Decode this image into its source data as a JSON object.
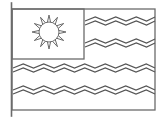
{
  "image": {
    "title": "Flag Coloring Page Outline",
    "subject": "national-flag-line-drawing",
    "width": 163,
    "height": 120,
    "background_color": "#ffffff",
    "line_color": "#6b6b6b",
    "line_color_dark": "#555555",
    "fill_color": "none"
  },
  "flagpole": {
    "name": "flagpole",
    "x": 11.5,
    "y_top": 3,
    "y_bottom": 116,
    "stroke_width": 1.6,
    "color": "#6b6b6b"
  },
  "flag": {
    "name": "flag-outline",
    "x_left": 12,
    "y_top": 9,
    "x_right": 155,
    "y_bottom": 110,
    "stroke_width": 1.3,
    "color": "#6b6b6b"
  },
  "canton": {
    "name": "canton-rectangle",
    "x_left": 12,
    "y_top": 9,
    "x_right": 84,
    "y_bottom": 59,
    "stroke_width": 1.3,
    "color": "#6b6b6b"
  },
  "sun": {
    "name": "sun-emblem",
    "center_x": 49,
    "center_y": 32,
    "circle_radius": 10,
    "ray_count": 12,
    "ray_inner_radius": 10,
    "ray_outer_radius": 17,
    "ray_half_angle_deg": 9,
    "stroke_width": 1,
    "color": "#6b6b6b"
  },
  "stripes": {
    "name": "zigzag-stripes",
    "count": 4,
    "period": 20.5,
    "amplitude": 4.2,
    "pair_offset": 4.0,
    "stroke_width": 1.1,
    "color": "#555555",
    "items": [
      {
        "id": 1,
        "center_y": 21,
        "x_start": 85,
        "x_end": 155,
        "span": "right-of-canton"
      },
      {
        "id": 2,
        "center_y": 43,
        "x_start": 85,
        "x_end": 155,
        "span": "right-of-canton"
      },
      {
        "id": 3,
        "center_y": 68,
        "x_start": 13,
        "x_end": 155,
        "span": "full-width"
      },
      {
        "id": 4,
        "center_y": 90,
        "x_start": 13,
        "x_end": 155,
        "span": "full-width"
      }
    ]
  }
}
